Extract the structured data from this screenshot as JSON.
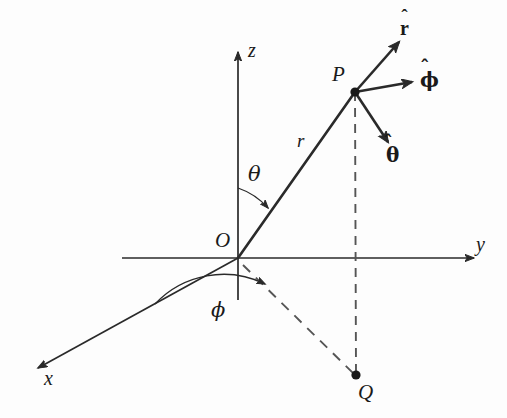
{
  "figure": {
    "background_color": "#fdfdfd",
    "ink_color": "#2a2a2a"
  },
  "axes": [
    {
      "id": "x",
      "label": "x",
      "label_x": 44,
      "label_y": 368,
      "from_x": 238,
      "from_y": 258,
      "to_x": 38,
      "to_y": 368
    },
    {
      "id": "y",
      "label": "y",
      "label_x": 476,
      "label_y": 234,
      "from_x": 122,
      "from_y": 258,
      "to_x": 474,
      "to_y": 258
    },
    {
      "id": "z",
      "label": "z",
      "label_x": 248,
      "label_y": 40,
      "from_x": 238,
      "from_y": 300,
      "to_x": 238,
      "to_y": 52
    }
  ],
  "points": [
    {
      "id": "O",
      "label": "O",
      "x": 238,
      "y": 258,
      "label_x": 215,
      "label_y": 230,
      "dot": false
    },
    {
      "id": "P",
      "label": "P",
      "x": 355,
      "y": 92,
      "label_x": 332,
      "label_y": 64,
      "dot": true
    },
    {
      "id": "Q",
      "label": "Q",
      "x": 356,
      "y": 375,
      "label_x": 358,
      "label_y": 382,
      "dot": true
    }
  ],
  "radial_line": {
    "label": "r",
    "label_x": 297,
    "label_y": 131,
    "from_x": 238,
    "from_y": 258,
    "to_x": 355,
    "to_y": 92
  },
  "unit_vectors": [
    {
      "id": "r-hat",
      "base": "r",
      "label": "r̂",
      "label_x": 400,
      "label_y": 18,
      "from_x": 355,
      "from_y": 92,
      "to_x": 399,
      "to_y": 42
    },
    {
      "id": "phi-hat",
      "base": "ϕ",
      "label": "ϕ̂",
      "label_x": 420,
      "label_y": 70,
      "from_x": 355,
      "from_y": 92,
      "to_x": 412,
      "to_y": 82
    },
    {
      "id": "theta-hat",
      "base": "θ",
      "label": "θ̂",
      "label_x": 386,
      "label_y": 145,
      "from_x": 355,
      "from_y": 92,
      "to_x": 388,
      "to_y": 142
    }
  ],
  "angles": [
    {
      "id": "theta",
      "label": "θ",
      "label_x": 248,
      "label_y": 164,
      "vertex_x": 238,
      "vertex_y": 258,
      "start_x": 238,
      "start_y": 188,
      "end_x": 268,
      "end_y": 208,
      "radius": 70
    },
    {
      "id": "phi",
      "label": "ϕ",
      "label_x": 211,
      "label_y": 300,
      "vertex_x": 238,
      "vertex_y": 258,
      "start_x": 155,
      "start_y": 304,
      "end_x": 265,
      "end_y": 284,
      "radius": 94
    }
  ],
  "dashed_lines": [
    {
      "id": "P-to-Q",
      "from_x": 355,
      "from_y": 92,
      "to_x": 356,
      "to_y": 373
    },
    {
      "id": "O-to-Q",
      "from_x": 243,
      "from_y": 265,
      "to_x": 353,
      "to_y": 373
    }
  ],
  "stroke_widths": {
    "axis": 1.7,
    "radial": 2.6,
    "unit_vector": 2.6,
    "arc": 1.3,
    "dashed": 1.9
  }
}
